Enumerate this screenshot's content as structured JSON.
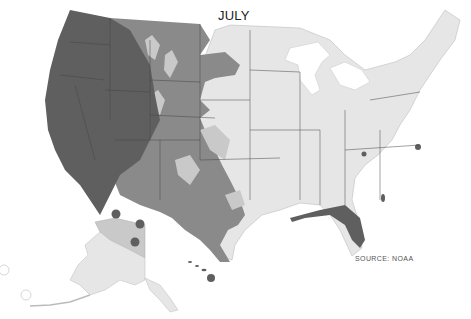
{
  "map": {
    "title": "JULY",
    "source": "SOURCE: NOAA",
    "region": "United States (contiguous, Alaska, Hawaii)",
    "colors": {
      "background": "#ffffff",
      "level_darkest": "#5f5f5f",
      "level_dark": "#8a8a8a",
      "level_light": "#c9c9c9",
      "level_lightest": "#e6e6e6",
      "state_border": "#444444",
      "water": "#ffffff"
    },
    "zones": [
      {
        "name": "west-coast-great-basin",
        "shade": "level_darkest"
      },
      {
        "name": "rocky-mountains-plains",
        "shade": "level_dark"
      },
      {
        "name": "mountain-highlands",
        "shade": "level_light"
      },
      {
        "name": "eastern-us",
        "shade": "level_lightest"
      },
      {
        "name": "gulf-coast-florida",
        "shade": "level_darkest"
      },
      {
        "name": "alaska-north",
        "shade": "level_light"
      },
      {
        "name": "alaska-south",
        "shade": "level_lightest"
      },
      {
        "name": "hawaii",
        "shade": "level_darkest"
      }
    ],
    "markers": [
      {
        "name": "alaska-marker-1",
        "x": 116,
        "y": 214
      },
      {
        "name": "alaska-marker-2",
        "x": 140,
        "y": 224
      },
      {
        "name": "alaska-marker-3",
        "x": 135,
        "y": 242
      }
    ]
  }
}
